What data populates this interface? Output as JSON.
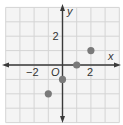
{
  "chart_data": {
    "type": "scatter",
    "title": "",
    "xlabel": "x",
    "ylabel": "y",
    "origin_label": "O",
    "xlim": [
      -4,
      4
    ],
    "ylim": [
      -4,
      4
    ],
    "grid": true,
    "grid_step": 1,
    "x_tick_labels": [
      {
        "value": -2,
        "label": "−2"
      },
      {
        "value": 2,
        "label": "2"
      }
    ],
    "y_tick_labels": [
      {
        "value": 2,
        "label": "2"
      }
    ],
    "series": [
      {
        "name": "points",
        "points": [
          {
            "x": -1,
            "y": -2
          },
          {
            "x": 0,
            "y": -1
          },
          {
            "x": 1,
            "y": 0
          },
          {
            "x": 2,
            "y": 1
          }
        ]
      }
    ]
  },
  "colors": {
    "grid": "#d4d4d4",
    "grid_bg": "#f4f4f4",
    "axis": "#3a3a3a",
    "point": "#7a7a7a",
    "text": "#333333"
  }
}
